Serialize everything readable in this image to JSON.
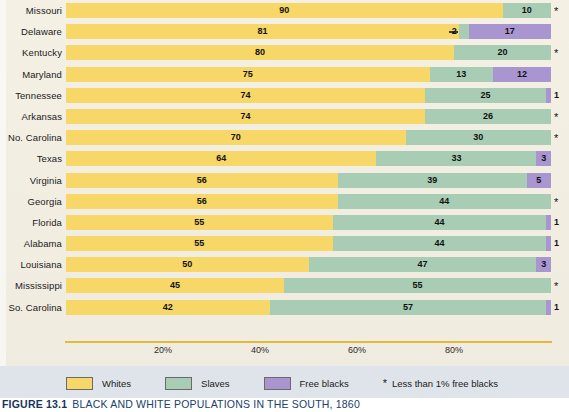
{
  "figure": {
    "number_label": "FIGURE 13.1",
    "title": "BLACK AND WHITE POPULATIONS IN THE SOUTH, 1860"
  },
  "legend": {
    "items": [
      {
        "label": "Whites",
        "color": "#f6d768",
        "key": "whites"
      },
      {
        "label": "Slaves",
        "color": "#a8cdb4",
        "key": "slaves"
      },
      {
        "label": "Free blacks",
        "color": "#a995d0",
        "key": "free_blacks"
      }
    ],
    "note_symbol": "*",
    "note_text": "Less than 1% free blacks"
  },
  "axis": {
    "tick_labels": [
      "20%",
      "40%",
      "60%",
      "80%"
    ],
    "tick_values": [
      20,
      40,
      60,
      80
    ],
    "min": 0,
    "max": 100
  },
  "chart_data": {
    "type": "bar",
    "orientation": "horizontal",
    "stacked": true,
    "normalized_percent": true,
    "title": "BLACK AND WHITE POPULATIONS IN THE SOUTH, 1860",
    "xlabel": "",
    "ylabel": "",
    "xlim": [
      0,
      100
    ],
    "grid": false,
    "legend_position": "bottom",
    "categories": [
      "Missouri",
      "Delaware",
      "Kentucky",
      "Maryland",
      "Tennessee",
      "Arkansas",
      "No. Carolina",
      "Texas",
      "Virginia",
      "Georgia",
      "Florida",
      "Alabama",
      "Louisiana",
      "Mississippi",
      "So. Carolina"
    ],
    "series": [
      {
        "name": "Whites",
        "color": "#f6d768",
        "values": [
          90,
          81,
          80,
          75,
          74,
          74,
          70,
          64,
          56,
          56,
          55,
          55,
          50,
          45,
          42
        ]
      },
      {
        "name": "Slaves",
        "color": "#a8cdb4",
        "values": [
          10,
          2,
          20,
          13,
          25,
          26,
          30,
          33,
          39,
          44,
          44,
          44,
          47,
          55,
          57
        ]
      },
      {
        "name": "Free blacks",
        "color": "#a995d0",
        "values": [
          0,
          17,
          0,
          12,
          1,
          0,
          0,
          3,
          5,
          0,
          1,
          1,
          3,
          0,
          1
        ]
      }
    ],
    "rows": [
      {
        "state": "Missouri",
        "whites": 90,
        "whites_label": "90",
        "slaves": 10,
        "slaves_label": "10",
        "free_blacks": 0,
        "free_blacks_label": "",
        "marker": "*",
        "marker_is_star": true
      },
      {
        "state": "Delaware",
        "whites": 81,
        "whites_label": "81",
        "slaves": 2,
        "slaves_label": "2",
        "slaves_label_outside": true,
        "free_blacks": 17,
        "free_blacks_label": "17",
        "marker": "",
        "marker_is_star": false
      },
      {
        "state": "Kentucky",
        "whites": 80,
        "whites_label": "80",
        "slaves": 20,
        "slaves_label": "20",
        "free_blacks": 0,
        "free_blacks_label": "",
        "marker": "*",
        "marker_is_star": true
      },
      {
        "state": "Maryland",
        "whites": 75,
        "whites_label": "75",
        "slaves": 13,
        "slaves_label": "13",
        "free_blacks": 12,
        "free_blacks_label": "12",
        "marker": "",
        "marker_is_star": false
      },
      {
        "state": "Tennessee",
        "whites": 74,
        "whites_label": "74",
        "slaves": 25,
        "slaves_label": "25",
        "free_blacks": 1,
        "free_blacks_label": "",
        "marker": "1",
        "marker_is_star": false
      },
      {
        "state": "Arkansas",
        "whites": 74,
        "whites_label": "74",
        "slaves": 26,
        "slaves_label": "26",
        "free_blacks": 0,
        "free_blacks_label": "",
        "marker": "*",
        "marker_is_star": true
      },
      {
        "state": "No. Carolina",
        "whites": 70,
        "whites_label": "70",
        "slaves": 30,
        "slaves_label": "30",
        "free_blacks": 0,
        "free_blacks_label": "",
        "marker": "*",
        "marker_is_star": true
      },
      {
        "state": "Texas",
        "whites": 64,
        "whites_label": "64",
        "slaves": 33,
        "slaves_label": "33",
        "free_blacks": 3,
        "free_blacks_label": "3",
        "marker": "",
        "marker_is_star": false
      },
      {
        "state": "Virginia",
        "whites": 56,
        "whites_label": "56",
        "slaves": 39,
        "slaves_label": "39",
        "free_blacks": 5,
        "free_blacks_label": "5",
        "marker": "",
        "marker_is_star": false
      },
      {
        "state": "Georgia",
        "whites": 56,
        "whites_label": "56",
        "slaves": 44,
        "slaves_label": "44",
        "free_blacks": 0,
        "free_blacks_label": "",
        "marker": "*",
        "marker_is_star": true
      },
      {
        "state": "Florida",
        "whites": 55,
        "whites_label": "55",
        "slaves": 44,
        "slaves_label": "44",
        "free_blacks": 1,
        "free_blacks_label": "",
        "marker": "1",
        "marker_is_star": false
      },
      {
        "state": "Alabama",
        "whites": 55,
        "whites_label": "55",
        "slaves": 44,
        "slaves_label": "44",
        "free_blacks": 1,
        "free_blacks_label": "",
        "marker": "1",
        "marker_is_star": false
      },
      {
        "state": "Louisiana",
        "whites": 50,
        "whites_label": "50",
        "slaves": 47,
        "slaves_label": "47",
        "free_blacks": 3,
        "free_blacks_label": "3",
        "marker": "",
        "marker_is_star": false
      },
      {
        "state": "Mississippi",
        "whites": 45,
        "whites_label": "45",
        "slaves": 55,
        "slaves_label": "55",
        "free_blacks": 0,
        "free_blacks_label": "",
        "marker": "*",
        "marker_is_star": true
      },
      {
        "state": "So. Carolina",
        "whites": 42,
        "whites_label": "42",
        "slaves": 57,
        "slaves_label": "57",
        "free_blacks": 1,
        "free_blacks_label": "",
        "marker": "1",
        "marker_is_star": false
      }
    ]
  }
}
